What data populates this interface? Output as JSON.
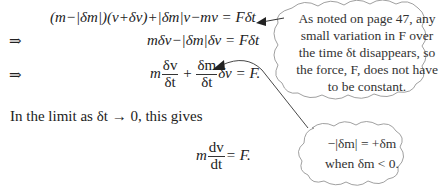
{
  "equations": {
    "eq1": {
      "lhs": "(m−|δm|)(v+δv)+|δm|v−mv",
      "rhs": "= Fδt"
    },
    "eq2": {
      "prefix": "⇒",
      "lhs": "mδv−|δm|δv",
      "rhs": "= Fδt"
    },
    "eq3": {
      "prefix": "⇒",
      "m": "m",
      "frac1_num": "δv",
      "frac1_den": "δt",
      "plus": "+",
      "frac2_num": "δm",
      "frac2_den": "δt",
      "tail": "δv = F."
    },
    "eq4": {
      "m": "m",
      "frac_num": "dv",
      "frac_den": "dt",
      "tail": "= F."
    }
  },
  "body_text": {
    "limit_line": "In the limit as δt → 0, this gives"
  },
  "callouts": {
    "top": {
      "lines": [
        "As noted on page 47, any",
        "small variation in F over",
        "the time δt disappears, so",
        "the force, F, does not have",
        "to be constant."
      ]
    },
    "bottom": {
      "lines": [
        "−|δm| = +δm",
        "when δm < 0."
      ]
    }
  }
}
